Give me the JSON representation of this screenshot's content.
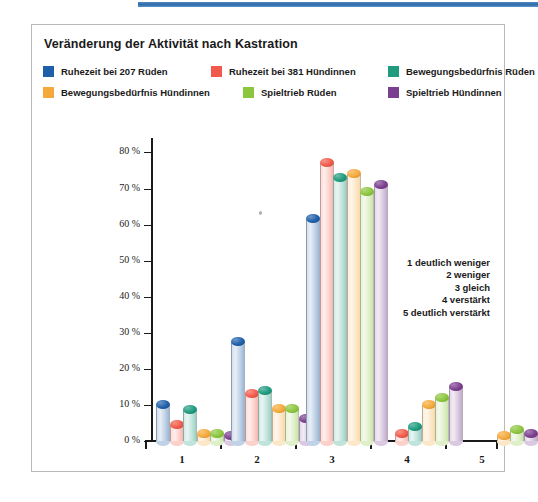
{
  "figure": {
    "title": "Veränderung der Aktivität nach Kastration"
  },
  "legend": {
    "items": [
      {
        "label": "Ruhezeit bei 207 Rüden",
        "color": "#1f5fa9"
      },
      {
        "label": "Ruhezeit bei 381 Hündinnen",
        "color": "#f15a4a"
      },
      {
        "label": "Bewegungsbedürfnis Rüden",
        "color": "#1f9b7e"
      },
      {
        "label": "Bewegungsbedürfnis Hündinnen",
        "color": "#f5a93a"
      },
      {
        "label": "Spieltrieb Rüden",
        "color": "#8cc63e"
      },
      {
        "label": "Spieltrieb Hündinnen",
        "color": "#7b3f8f"
      }
    ]
  },
  "scale_key": {
    "lines": [
      "1 deutlich weniger",
      "2 weniger",
      "3 gleich",
      "4 verstärkt",
      "5 deutlich verstärkt"
    ]
  },
  "chart_data": {
    "type": "bar",
    "title": "Veränderung der Aktivität nach Kastration",
    "xlabel": "",
    "ylabel": "",
    "ylim": [
      0,
      84
    ],
    "grid": false,
    "legend_position": "top",
    "categories": [
      "1",
      "2",
      "3",
      "4",
      "5"
    ],
    "category_meaning": {
      "1": "deutlich weniger",
      "2": "weniger",
      "3": "gleich",
      "4": "verstärkt",
      "5": "deutlich verstärkt"
    },
    "ytick_labels": [
      "0 %",
      "10 %",
      "20 %",
      "30 %",
      "40 %",
      "50 %",
      "60 %",
      "70 %",
      "80 %"
    ],
    "ytick_values": [
      0,
      10,
      20,
      30,
      40,
      50,
      60,
      70,
      80
    ],
    "unit": "%",
    "series": [
      {
        "name": "Ruhezeit bei 207 Rüden",
        "color": "#1f5fa9",
        "values": [
          10.0,
          27.5,
          61.5,
          0.0,
          0.0
        ]
      },
      {
        "name": "Ruhezeit bei 381 Hündinnen",
        "color": "#f15a4a",
        "values": [
          4.5,
          13.0,
          77.0,
          2.0,
          0.0
        ]
      },
      {
        "name": "Bewegungsbedürfnis Rüden",
        "color": "#1f9b7e",
        "values": [
          8.5,
          14.0,
          73.0,
          4.0,
          0.0
        ]
      },
      {
        "name": "Bewegungsbedürfnis Hündinnen",
        "color": "#f5a93a",
        "values": [
          2.0,
          9.0,
          74.0,
          10.0,
          1.5
        ]
      },
      {
        "name": "Spieltrieb Rüden",
        "color": "#8cc63e",
        "values": [
          2.0,
          9.0,
          69.0,
          12.0,
          3.0
        ]
      },
      {
        "name": "Spieltrieb Hündinnen",
        "color": "#7b3f8f",
        "values": [
          1.5,
          6.0,
          71.0,
          15.0,
          2.0
        ]
      }
    ]
  }
}
